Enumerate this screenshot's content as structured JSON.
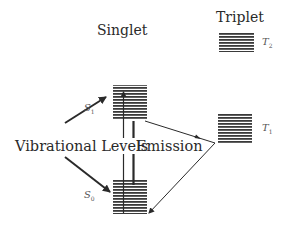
{
  "headings": {
    "singlet": "Singlet",
    "triplet": "Triplet"
  },
  "states": {
    "s1": {
      "symbol": "S",
      "subscript": "1"
    },
    "s0": {
      "symbol": "S",
      "subscript": "0"
    },
    "t1": {
      "symbol": "T",
      "subscript": "1"
    },
    "t2": {
      "symbol": "T",
      "subscript": "2"
    }
  },
  "annotations": {
    "vibrational_levels": "Vibrational Levels",
    "emission": "Emission"
  },
  "colors": {
    "line": "#2a2a2a",
    "level_stripe": "#3a3a3a",
    "background": "#ffffff"
  }
}
